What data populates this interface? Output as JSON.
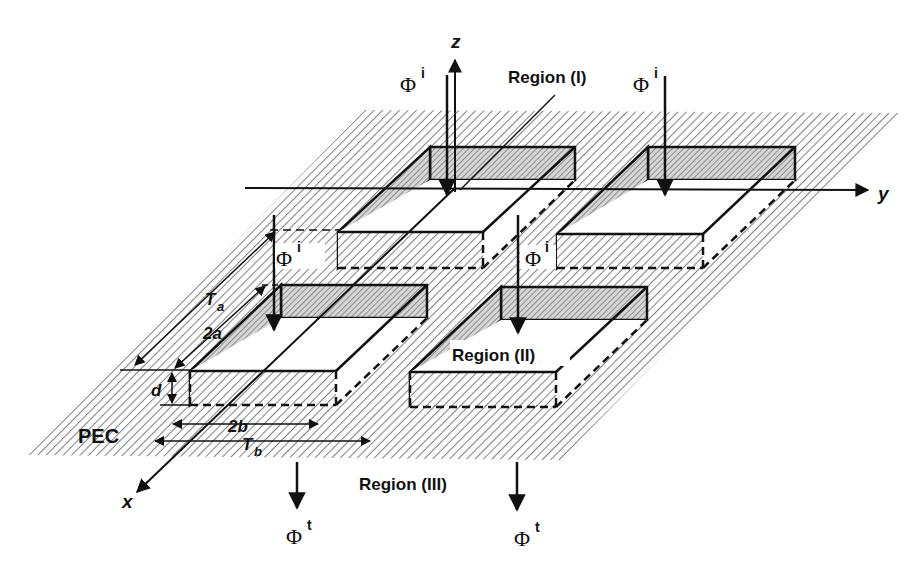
{
  "figure": {
    "axes": {
      "x": "x",
      "y": "y",
      "z": "z"
    },
    "regions": {
      "region1": "Region (I)",
      "region2": "Region (II)",
      "region3": "Region (III)"
    },
    "material": "PEC",
    "dimensions": {
      "Ta": "T",
      "Ta_sub": "a",
      "two_a": "2a",
      "d": "d",
      "two_b": "2b",
      "Tb": "T",
      "Tb_sub": "b"
    },
    "fields": {
      "incident_symbol": "Φ",
      "incident_sup": "i",
      "transmitted_symbol": "Φ",
      "transmitted_sup": "t"
    },
    "colors": {
      "ink": "#111111",
      "hatch": "#333333",
      "background": "#ffffff",
      "wall_fill": "#cfcfcf"
    }
  }
}
